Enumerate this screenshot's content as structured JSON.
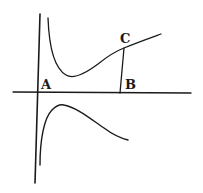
{
  "figure": {
    "type": "curve-with-asymptote",
    "colors": {
      "background": "#ffffff",
      "ink": "#1a1a1a"
    },
    "labels": {
      "A": "A",
      "B": "B",
      "C": "C"
    },
    "elements": [
      {
        "id": "horizontal-axis",
        "description": "horizontal axis line through A and B"
      },
      {
        "id": "vertical-asymptote",
        "description": "vertical axis through A"
      },
      {
        "id": "upper-branch",
        "description": "curve descending from asymptote, minimum, then rising through C"
      },
      {
        "id": "lower-branch",
        "description": "curve rising from asymptote below axis, maximum, then descending"
      },
      {
        "id": "ordinate-CB",
        "description": "vertical segment from C down to B on the axis"
      }
    ]
  }
}
